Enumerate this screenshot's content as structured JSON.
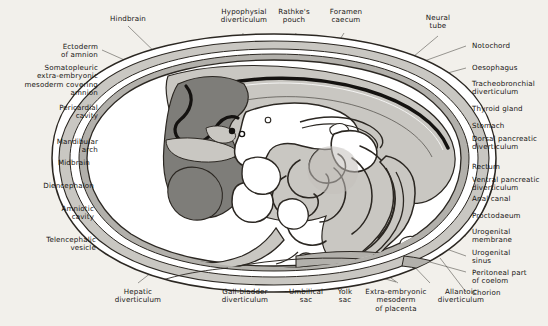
{
  "figure": {
    "type": "anatomical-diagram",
    "background_color": "#f2f0eb",
    "palette": {
      "ink": "#171513",
      "outline": "#2b2722",
      "leader_line": "#4a4742",
      "amnion_fluid": "#ffffff",
      "mesoderm_light": "#c9c7c2",
      "mesoderm_mid": "#b2b0ab",
      "body_wall": "#bcbab5",
      "brain_dark": "#7e7d79",
      "neural_canal": "#141210",
      "gut_lumen": "#ffffff",
      "gut_wall": "#c2c0bb"
    },
    "labels_top": [
      {
        "id": "hindbrain",
        "text": "Hindbrain"
      },
      {
        "id": "hypophysial-diverticulum",
        "text": "Hypophysial\ndiverticulum"
      },
      {
        "id": "rathkes-pouch",
        "text": "Rathke's\npouch"
      },
      {
        "id": "foramen-caecum",
        "text": "Foramen\ncaecum"
      },
      {
        "id": "neural-tube",
        "text": "Neural\ntube"
      }
    ],
    "labels_left": [
      {
        "id": "ectoderm-of-amnion",
        "text": "Ectoderm\nof amnion"
      },
      {
        "id": "somatopleuric-mesoderm",
        "text": "Somatopleuric\nextra-embryonic\nmesoderm covering\namnion"
      },
      {
        "id": "pericardial-cavity",
        "text": "Pericardial\ncavity"
      },
      {
        "id": "mandibular-arch",
        "text": "Mandibular\narch"
      },
      {
        "id": "midbrain",
        "text": "Midbrain"
      },
      {
        "id": "diencephalon",
        "text": "Diencephalon"
      },
      {
        "id": "amniotic-cavity",
        "text": "Amniotic\ncavity"
      },
      {
        "id": "telencephalic-vesicle",
        "text": "Telencephalic\nvesicle"
      }
    ],
    "labels_right": [
      {
        "id": "notochord",
        "text": "Notochord"
      },
      {
        "id": "oesophagus",
        "text": "Oesophagus"
      },
      {
        "id": "tracheobronchial-diverticulum",
        "text": "Tracheobronchial\ndiverticulum"
      },
      {
        "id": "thyroid-gland",
        "text": "Thyroid gland"
      },
      {
        "id": "stomach",
        "text": "Stomach"
      },
      {
        "id": "dorsal-pancreatic-diverticulum",
        "text": "Dorsal pancreatic\ndiverticulum"
      },
      {
        "id": "rectum",
        "text": "Rectum"
      },
      {
        "id": "ventral-pancreatic-diverticulum",
        "text": "Ventral pancreatic\ndiverticulum"
      },
      {
        "id": "anal-canal",
        "text": "Anal canal"
      },
      {
        "id": "proctodaeum",
        "text": "Proctodaeum"
      },
      {
        "id": "urogenital-membrane",
        "text": "Urogenital\nmembrane"
      },
      {
        "id": "urogenital-sinus",
        "text": "Urogenital\nsinus"
      },
      {
        "id": "peritoneal-part-of-coelom",
        "text": "Peritoneal part\nof coelom"
      },
      {
        "id": "chorion",
        "text": "Chorion"
      }
    ],
    "labels_bottom": [
      {
        "id": "hepatic-diverticulum",
        "text": "Hepatic\ndiverticulum"
      },
      {
        "id": "gall-bladder-diverticulum",
        "text": "Gall-bladder\ndiverticulum"
      },
      {
        "id": "umbilical-sac",
        "text": "Umbilical\nsac"
      },
      {
        "id": "yolk-sac",
        "text": "Yolk\nsac"
      },
      {
        "id": "extra-embryonic-mesoderm-of-placenta",
        "text": "Extra-embryonic\nmesoderm\nof placenta"
      },
      {
        "id": "allantoic-diverticulum",
        "text": "Allantoic\ndiverticulum"
      }
    ]
  }
}
